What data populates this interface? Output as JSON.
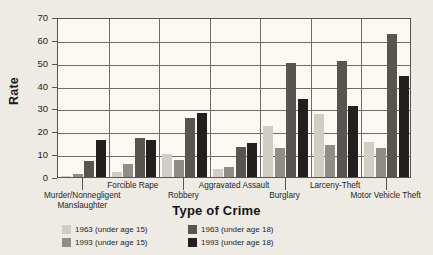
{
  "chart_data": {
    "type": "bar",
    "title": "Type of Crime",
    "xlabel": "Type of Crime",
    "ylabel": "Rate",
    "ylim": [
      0,
      70
    ],
    "yticks": [
      0,
      10,
      20,
      30,
      40,
      50,
      60,
      70
    ],
    "grid": true,
    "legend_position": "bottom-left",
    "categories": [
      "Murder/Nonnegligent Manslaughter",
      "Forcible Rape",
      "Robbery",
      "Aggravated Assault",
      "Burglary",
      "Larceny-Theft",
      "Motor Vehicle Theft"
    ],
    "category_labels": [
      {
        "line1": "Murder/Nonnegligent",
        "line2": "Manslaughter"
      },
      {
        "line1": "Forcible Rape",
        "line2": ""
      },
      {
        "line1": "Robbery",
        "line2": ""
      },
      {
        "line1": "Aggravated Assault",
        "line2": ""
      },
      {
        "line1": "Burglary",
        "line2": ""
      },
      {
        "line1": "Larceny-Theft",
        "line2": ""
      },
      {
        "line1": "Motor Vehicle Theft",
        "line2": ""
      }
    ],
    "series": [
      {
        "name": "1963 (under age 15)",
        "color": "#cfcdc4",
        "values": [
          0.3,
          2,
          10,
          3.7,
          22.5,
          27.7,
          15.2
        ]
      },
      {
        "name": "1993 (under age 15)",
        "color": "#8f8d85",
        "values": [
          1.5,
          5.6,
          7.6,
          4.4,
          12.8,
          13.8,
          12.9
        ]
      },
      {
        "name": "1963 (under age 18)",
        "color": "#56554f",
        "values": [
          7.2,
          17.2,
          25.7,
          13.3,
          50,
          50.9,
          62.4
        ]
      },
      {
        "name": "1993 (under age 18)",
        "color": "#231f1c",
        "values": [
          16,
          16,
          27.9,
          14.9,
          34,
          31,
          44.2
        ]
      }
    ]
  },
  "legend": {
    "items": [
      {
        "label": "1963 (under age 15)",
        "color": "#cfcdc4"
      },
      {
        "label": "1963 (under age 18)",
        "color": "#56554f"
      },
      {
        "label": "1993 (under age 15)",
        "color": "#8f8d85"
      },
      {
        "label": "1993 (under age 18)",
        "color": "#231f1c"
      }
    ]
  }
}
